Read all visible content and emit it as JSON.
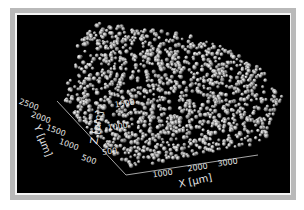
{
  "figure": {
    "background": "#000000",
    "frame_color": "#b9b9b9",
    "particle_color": "#d8d8d8",
    "axis_color": "#cfcfcf",
    "particles": {
      "count": 1400,
      "outline": [
        [
          86,
          24
        ],
        [
          120,
          26
        ],
        [
          160,
          30
        ],
        [
          200,
          38
        ],
        [
          232,
          50
        ],
        [
          262,
          70
        ],
        [
          282,
          96
        ],
        [
          276,
          120
        ],
        [
          265,
          140
        ],
        [
          220,
          150
        ],
        [
          180,
          158
        ],
        [
          132,
          168
        ],
        [
          108,
          150
        ],
        [
          78,
          122
        ],
        [
          65,
          100
        ],
        [
          70,
          70
        ],
        [
          78,
          45
        ]
      ]
    }
  },
  "axes": {
    "x": {
      "label": "X [μm]",
      "ticks": [
        {
          "text": "1000",
          "x": 163,
          "y": 176,
          "rot": -9
        },
        {
          "text": "2000",
          "x": 198,
          "y": 170,
          "rot": -9
        },
        {
          "text": "3000",
          "x": 228,
          "y": 165,
          "rot": -9
        }
      ],
      "label_pos": {
        "x": 196,
        "y": 184,
        "rot": -12
      },
      "line": [
        [
          126,
          175
        ],
        [
          258,
          155
        ]
      ]
    },
    "y": {
      "label": "Y [μm]",
      "ticks": [
        {
          "text": "2500",
          "x": 28,
          "y": 107,
          "rot": 20
        },
        {
          "text": "2000",
          "x": 40,
          "y": 120,
          "rot": 20
        },
        {
          "text": "1500",
          "x": 55,
          "y": 133,
          "rot": 20
        },
        {
          "text": "1000",
          "x": 68,
          "y": 147,
          "rot": 20
        },
        {
          "text": "500",
          "x": 88,
          "y": 162,
          "rot": 20
        }
      ],
      "label_pos": {
        "x": 40,
        "y": 142,
        "rot": 68
      },
      "line": [
        [
          57,
          101
        ],
        [
          126,
          175
        ]
      ]
    },
    "z": {
      "label": "Z [μm]",
      "ticks": [
        {
          "text": "1500",
          "x": 125,
          "y": 106,
          "rot": -8
        },
        {
          "text": "1000",
          "x": 118,
          "y": 129,
          "rot": -8
        },
        {
          "text": "500",
          "x": 110,
          "y": 154,
          "rot": -8
        }
      ],
      "label_pos": {
        "x": 100,
        "y": 128,
        "rot": -80
      }
    }
  }
}
